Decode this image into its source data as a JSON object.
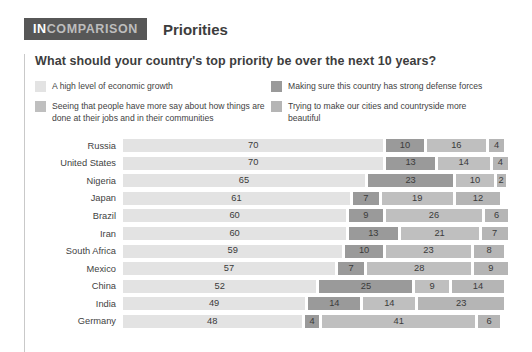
{
  "brand": {
    "prefix": "IN",
    "suffix": "COMPARISON"
  },
  "header": {
    "title": "Priorities"
  },
  "question": "What should your country's top priority be over the next 10 years?",
  "colors": {
    "series_economic_growth": "#e3e3e3",
    "series_more_say": "#bfbfbf",
    "series_defense": "#9a9a9a",
    "series_beautiful": "#b5b5b5",
    "badge_bg": "#575757",
    "badge_text": "#ffffff",
    "badge_text_muted": "#bdbdbd",
    "text": "#3a3a3a",
    "rule": "#c9c9c9"
  },
  "legend": {
    "columns": [
      [
        {
          "swatch": "#e3e3e3",
          "label": "A high level of economic growth",
          "icon": "legend-swatch-economic-growth"
        },
        {
          "swatch": "#bfbfbf",
          "label": "Seeing that people have more say about how things are done at their jobs and in their communities",
          "icon": "legend-swatch-more-say"
        }
      ],
      [
        {
          "swatch": "#9a9a9a",
          "label": "Making sure this country has strong defense forces",
          "icon": "legend-swatch-defense"
        },
        {
          "swatch": "#b5b5b5",
          "label": "Trying to make our cities and countryside more beautiful",
          "icon": "legend-swatch-beautiful"
        }
      ]
    ]
  },
  "chart_data": {
    "type": "bar",
    "subtype": "stacked-horizontal",
    "title": "Priorities",
    "subtitle": "What should your country's top priority be over the next 10 years?",
    "xlabel": "",
    "ylabel": "",
    "unit": "percent",
    "grid": false,
    "legend_position": "top",
    "xlim": [
      0,
      100
    ],
    "categories": [
      "Russia",
      "United States",
      "Nigeria",
      "Japan",
      "Brazil",
      "Iran",
      "South Africa",
      "Mexico",
      "China",
      "India",
      "Germany"
    ],
    "series": [
      {
        "name": "A high level of economic growth",
        "color": "#e3e3e3",
        "values": [
          70,
          70,
          65,
          61,
          60,
          60,
          59,
          57,
          52,
          49,
          48
        ]
      },
      {
        "name": "Making sure this country has strong defense forces",
        "color": "#9a9a9a",
        "values": [
          10,
          13,
          23,
          7,
          9,
          13,
          10,
          7,
          25,
          14,
          4
        ]
      },
      {
        "name": "Seeing that people have more say about how things are done at their jobs and in their communities",
        "color": "#bfbfbf",
        "values": [
          16,
          14,
          10,
          19,
          26,
          21,
          23,
          28,
          9,
          14,
          41
        ]
      },
      {
        "name": "Trying to make our cities and countryside more beautiful",
        "color": "#b5b5b5",
        "values": [
          4,
          4,
          2,
          12,
          6,
          7,
          8,
          9,
          14,
          23,
          6
        ]
      }
    ],
    "rows": [
      {
        "label": "Russia",
        "values": [
          70,
          10,
          16,
          4
        ]
      },
      {
        "label": "United States",
        "values": [
          70,
          13,
          14,
          4
        ]
      },
      {
        "label": "Nigeria",
        "values": [
          65,
          23,
          10,
          2
        ]
      },
      {
        "label": "Japan",
        "values": [
          61,
          7,
          19,
          12
        ]
      },
      {
        "label": "Brazil",
        "values": [
          60,
          9,
          26,
          6
        ]
      },
      {
        "label": "Iran",
        "values": [
          60,
          13,
          21,
          7
        ]
      },
      {
        "label": "South Africa",
        "values": [
          59,
          10,
          23,
          8
        ]
      },
      {
        "label": "Mexico",
        "values": [
          57,
          7,
          28,
          9
        ]
      },
      {
        "label": "China",
        "values": [
          52,
          25,
          9,
          14
        ]
      },
      {
        "label": "India",
        "values": [
          49,
          14,
          14,
          23
        ]
      },
      {
        "label": "Germany",
        "values": [
          48,
          4,
          41,
          6
        ]
      }
    ],
    "segment_colors": [
      "#e3e3e3",
      "#9a9a9a",
      "#bfbfbf",
      "#b5b5b5"
    ]
  }
}
